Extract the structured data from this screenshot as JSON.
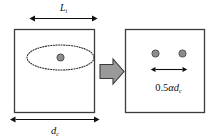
{
  "figure": {
    "type": "schematic-diagram",
    "colors": {
      "outline": "#3b3b3b",
      "fill": "#ffffff",
      "dot_fill": "#8c8c8c",
      "dot_stroke": "#4a4a4a",
      "arrow_fill": "#9a9a9a",
      "arrow_stroke": "#3b3b3b",
      "dimension_line": "#101010",
      "text": "#101010"
    },
    "left_panel": {
      "name": "left-cross-section",
      "shape": "square",
      "top_dimension": {
        "label_base": "L",
        "label_subscript": "i",
        "label_full": "L i"
      },
      "bottom_dimension": {
        "label_base": "d",
        "label_subscript": "c",
        "label_full": "d c"
      },
      "ellipse": {
        "name": "dashed-ellipse",
        "style": "dotted"
      },
      "inclusion_count": 1
    },
    "transform_arrow": {
      "name": "transform-arrow",
      "direction": "right"
    },
    "right_panel": {
      "name": "right-cross-section",
      "shape": "square",
      "inclusion_count": 2,
      "spacing_dimension": {
        "label_prefix": "0.5",
        "label_alpha": "α",
        "label_base": "d",
        "label_subscript": "c",
        "label_full": "0.5αd c"
      }
    }
  }
}
